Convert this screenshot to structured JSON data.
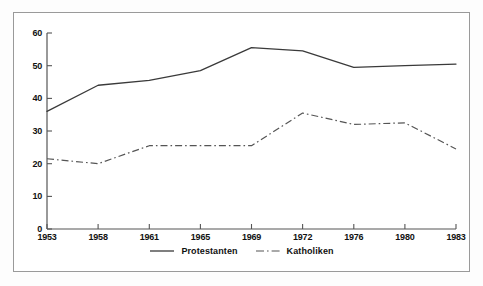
{
  "chart_data": {
    "type": "line",
    "title": "",
    "subtitle": "",
    "xlabel": "",
    "ylabel": "",
    "categories": [
      "1953",
      "1958",
      "1961",
      "1965",
      "1969",
      "1972",
      "1976",
      "1980",
      "1983"
    ],
    "series": [
      {
        "name": "Protestanten",
        "style": "solid",
        "color": "#3a3a3a",
        "values": [
          36,
          44,
          45.5,
          48.5,
          55.5,
          54.5,
          49.5,
          50,
          50.5
        ]
      },
      {
        "name": "Katholiken",
        "style": "dash-dot",
        "color": "#555555",
        "values": [
          21.5,
          20,
          25.5,
          25.5,
          25.5,
          35.5,
          32,
          32.5,
          24.5
        ]
      }
    ],
    "ylim": [
      0,
      60
    ],
    "yticks": [
      0,
      10,
      20,
      30,
      40,
      50,
      60
    ],
    "ytick_labels": [
      "0",
      "10",
      "20",
      "30",
      "40",
      "50",
      "60"
    ],
    "xtick_labels": [
      "1953",
      "1958",
      "1961",
      "1965",
      "1969",
      "1972",
      "1976",
      "1980",
      "1983"
    ],
    "grid": false,
    "legend_position": "bottom-center",
    "legend_entries": [
      "Protestanten",
      "Katholiken"
    ],
    "axis_color": "#555555",
    "frame_color": "#9a9a9a",
    "background": "#ffffff"
  }
}
